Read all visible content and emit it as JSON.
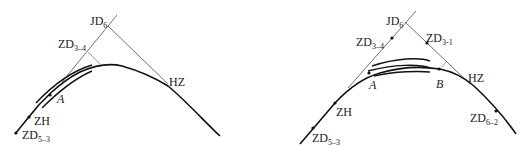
{
  "figures": [
    {
      "id": "left",
      "description": "Curve with tangent lines meeting at JD6, offset arcs near point A",
      "labels": {
        "jd": {
          "main": "JD",
          "sub": "6"
        },
        "zd_tangent": {
          "main": "ZD",
          "sub": "3–4"
        },
        "hz": {
          "main": "HZ"
        },
        "a": {
          "main": "A"
        },
        "zh": {
          "main": "ZH"
        },
        "zd_start": {
          "main": "ZD",
          "sub": "5–3"
        }
      }
    },
    {
      "id": "right",
      "description": "Curve with tangent lines meeting at JD6, offset arcs spanning points A to B",
      "labels": {
        "jd": {
          "main": "JD",
          "sub": "6"
        },
        "zd_left_tangent": {
          "main": "ZD",
          "sub": "3–4"
        },
        "zd_right_tangent": {
          "main": "ZD",
          "sub": "3-1"
        },
        "a": {
          "main": "A"
        },
        "b": {
          "main": "B"
        },
        "hz": {
          "main": "HZ"
        },
        "zh": {
          "main": "ZH"
        },
        "zd_start": {
          "main": "ZD",
          "sub": "5–3"
        },
        "zd_end": {
          "main": "ZD",
          "sub": "6–2"
        }
      }
    }
  ],
  "colors": {
    "line": "#111111",
    "tangent": "#333333",
    "background": "#ffffff"
  }
}
